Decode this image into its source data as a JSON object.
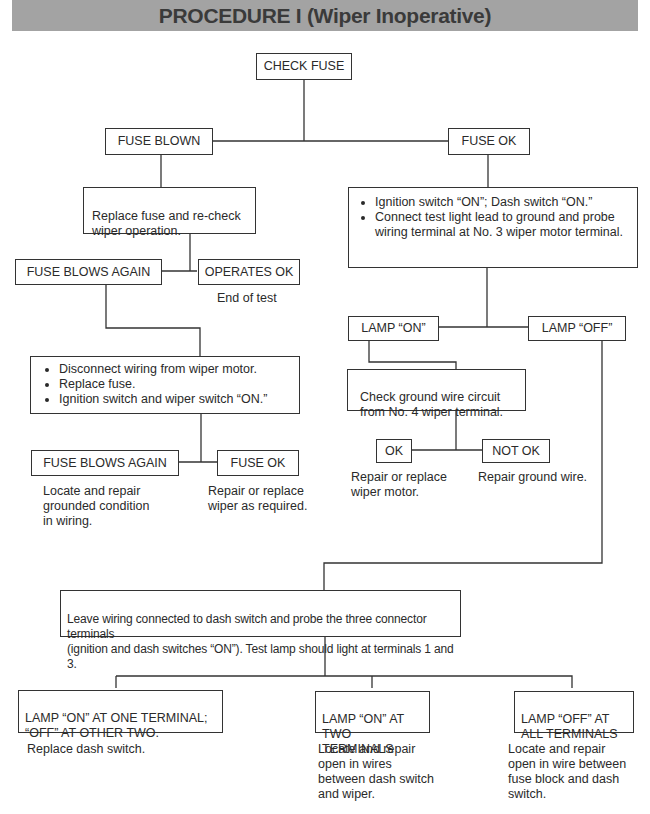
{
  "header": {
    "title": "PROCEDURE I (Wiper Inoperative)",
    "background": "#a3a3a3"
  },
  "nodes": {
    "check_fuse": "CHECK FUSE",
    "fuse_blown": "FUSE BLOWN",
    "fuse_ok": "FUSE OK",
    "replace_fuse": "Replace fuse and re-check\nwiper operation.",
    "fuse_blows_again_1": "FUSE BLOWS AGAIN",
    "operates_ok": "OPERATES OK",
    "operates_ok_note": "End of test",
    "ignition_steps": [
      "Ignition switch “ON”; Dash switch “ON.”",
      "Connect test light lead to ground and probe wiring terminal at No. 3 wiper motor terminal."
    ],
    "disconnect_steps": [
      "Disconnect wiring from wiper motor.",
      "Replace fuse.",
      "Ignition switch and wiper switch “ON.”"
    ],
    "lamp_on": "LAMP “ON”",
    "lamp_off": "LAMP “OFF”",
    "check_ground": "Check ground wire circuit\nfrom No. 4 wiper terminal.",
    "ok": "OK",
    "not_ok": "NOT OK",
    "ok_note": "Repair or replace\nwiper motor.",
    "not_ok_note": "Repair ground wire.",
    "fuse_blows_again_2": "FUSE BLOWS AGAIN",
    "fuse_ok_2": "FUSE OK",
    "fuse_blows_again_2_note": "Locate and repair\ngrounded condition\nin wiring.",
    "fuse_ok_2_note": "Repair or replace\nwiper as required.",
    "leave_wiring": "Leave wiring connected to dash switch and probe the three connector terminals\n(ignition and dash switches “ON”). Test lamp should light at terminals 1 and 3.",
    "lamp_on_one": "LAMP “ON” AT ONE TERMINAL;\n“OFF” AT  OTHER TWO.",
    "lamp_on_two": "LAMP “ON” AT\nTWO TERMINALS",
    "lamp_off_all": "LAMP “OFF” AT\nALL TERMINALS",
    "lamp_on_one_note": "Replace dash switch.",
    "lamp_on_two_note": "Locate and repair\nopen in wires\nbetween dash switch\nand wiper.",
    "lamp_off_all_note": "Locate and repair\nopen in wire between\nfuse block and dash\nswitch."
  }
}
